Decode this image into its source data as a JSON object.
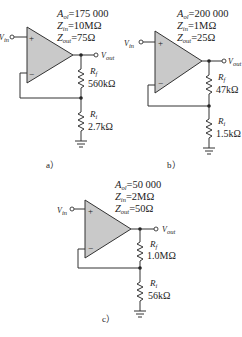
{
  "figure": {
    "circuits": [
      {
        "label": "a）",
        "params": {
          "aol": {
            "sym": "A",
            "sub": "ol",
            "val": "=175 000"
          },
          "zin": {
            "sym": "Z",
            "sub": "in",
            "val": "=10MΩ"
          },
          "zout": {
            "sym": "Z",
            "sub": "out",
            "val": "=75Ω"
          }
        },
        "vin": {
          "sym": "V",
          "sub": "in"
        },
        "vout": {
          "sym": "V",
          "sub": "out"
        },
        "rf": {
          "sym": "R",
          "sub": "f",
          "val": "560kΩ"
        },
        "ri": {
          "sym": "R",
          "sub": "i",
          "val": "2.7kΩ"
        },
        "plus": "+",
        "minus": "−"
      },
      {
        "label": "b）",
        "params": {
          "aol": {
            "sym": "A",
            "sub": "ol",
            "val": "=200 000"
          },
          "zin": {
            "sym": "Z",
            "sub": "in",
            "val": "=1MΩ"
          },
          "zout": {
            "sym": "Z",
            "sub": "out",
            "val": "=25Ω"
          }
        },
        "vin": {
          "sym": "V",
          "sub": "in"
        },
        "vout": {
          "sym": "V",
          "sub": "out"
        },
        "rf": {
          "sym": "R",
          "sub": "f",
          "val": "47kΩ"
        },
        "ri": {
          "sym": "R",
          "sub": "i",
          "val": "1.5kΩ"
        },
        "plus": "+",
        "minus": "−"
      },
      {
        "label": "c）",
        "params": {
          "aol": {
            "sym": "A",
            "sub": "ol",
            "val": "=50 000"
          },
          "zin": {
            "sym": "Z",
            "sub": "in",
            "val": "=2MΩ"
          },
          "zout": {
            "sym": "Z",
            "sub": "out",
            "val": "=50Ω"
          }
        },
        "vin": {
          "sym": "V",
          "sub": "in"
        },
        "vout": {
          "sym": "V",
          "sub": "out"
        },
        "rf": {
          "sym": "R",
          "sub": "f",
          "val": "1.0MΩ"
        },
        "ri": {
          "sym": "R",
          "sub": "i",
          "val": "56kΩ"
        },
        "plus": "+",
        "minus": "−"
      }
    ],
    "colors": {
      "opamp_fill": "#c9c9c9",
      "wire": "#333333",
      "text": "#222222"
    }
  }
}
